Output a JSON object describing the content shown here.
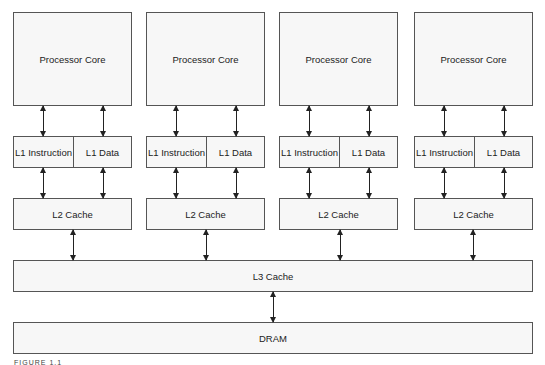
{
  "diagram": {
    "cores": [
      {
        "core_label": "Processor Core",
        "l1i_label": "L1 Instruction",
        "l1d_label": "L1 Data",
        "l2_label": "L2 Cache"
      },
      {
        "core_label": "Processor Core",
        "l1i_label": "L1 Instruction",
        "l1d_label": "L1 Data",
        "l2_label": "L2 Cache"
      },
      {
        "core_label": "Processor Core",
        "l1i_label": "L1 Instruction",
        "l1d_label": "L1 Data",
        "l2_label": "L2 Cache"
      },
      {
        "core_label": "Processor Core",
        "l1i_label": "L1 Instruction",
        "l1d_label": "L1 Data",
        "l2_label": "L2 Cache"
      }
    ],
    "l3_label": "L3 Cache",
    "dram_label": "DRAM",
    "caption": "FIGURE 1.1"
  }
}
